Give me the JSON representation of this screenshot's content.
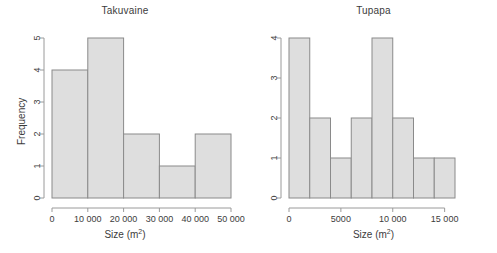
{
  "figure": {
    "background": "#ffffff",
    "bar_fill": "#dedede",
    "bar_stroke": "#8a8a8a",
    "axis_color": "#9a9a9a",
    "text_color": "#3c3c3c"
  },
  "axis_labels": {
    "x_label_prefix": "Size (m",
    "x_label_superscript": "2",
    "x_label_suffix": ")",
    "y_label": "Frequency"
  },
  "chart_data": [
    {
      "type": "bar",
      "title": "Takuvaine",
      "xlabel": "Size (m2)",
      "ylabel": "Frequency",
      "grid": false,
      "legend": "none",
      "xlim": [
        0,
        50000
      ],
      "ylim": [
        0,
        5
      ],
      "bin_width": 10000,
      "bin_edges": [
        0,
        10000,
        20000,
        30000,
        40000,
        50000
      ],
      "categories": [
        "0-10000",
        "10000-20000",
        "20000-30000",
        "30000-40000",
        "40000-50000"
      ],
      "values": [
        4,
        5,
        2,
        1,
        2
      ],
      "xticks": [
        0,
        10000,
        20000,
        30000,
        40000,
        50000
      ],
      "xticklabels": [
        "0",
        "10 000",
        "20 000",
        "30 000",
        "40 000",
        "50 000"
      ],
      "yticks": [
        0,
        1,
        2,
        3,
        4,
        5
      ],
      "yticklabels": [
        "0",
        "1",
        "2",
        "3",
        "4",
        "5"
      ]
    },
    {
      "type": "bar",
      "title": "Tupapa",
      "xlabel": "Size (m2)",
      "ylabel": "",
      "grid": false,
      "legend": "none",
      "xlim": [
        0,
        16000
      ],
      "ylim": [
        0,
        4
      ],
      "bin_width": 2000,
      "bin_edges": [
        0,
        2000,
        4000,
        6000,
        8000,
        10000,
        12000,
        14000,
        16000
      ],
      "categories": [
        "0-2000",
        "2000-4000",
        "4000-6000",
        "6000-8000",
        "8000-10000",
        "10000-12000",
        "12000-14000",
        "14000-16000"
      ],
      "values": [
        4,
        2,
        1,
        2,
        4,
        2,
        1,
        1
      ],
      "xticks": [
        0,
        5000,
        10000,
        15000
      ],
      "xticklabels": [
        "0",
        "5000",
        "10 000",
        "15 000"
      ],
      "yticks": [
        0,
        1,
        2,
        3,
        4
      ],
      "yticklabels": [
        "0",
        "1",
        "2",
        "3",
        "4"
      ]
    }
  ]
}
